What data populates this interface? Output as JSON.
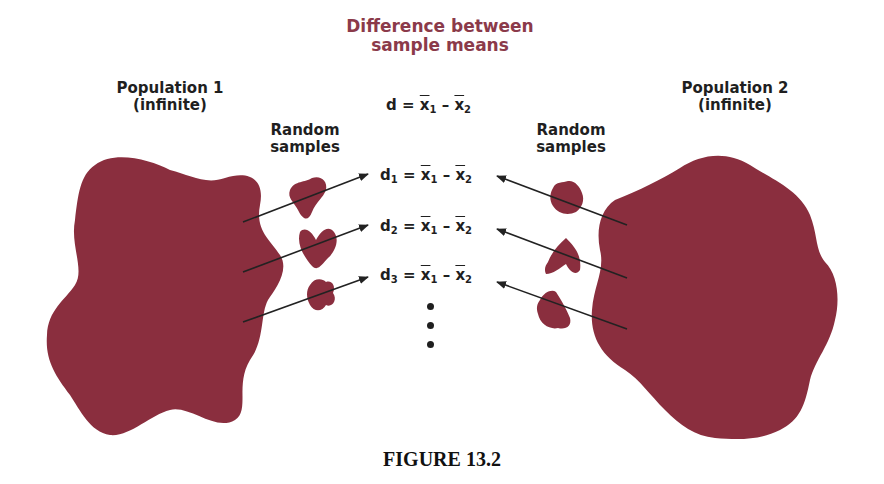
{
  "title": "Difference between sample means",
  "title_lines": [
    "Difference between",
    "sample means"
  ],
  "population1": {
    "label": "Population 1",
    "sublabel": "(infinite)"
  },
  "population2": {
    "label": "Population 2",
    "sublabel": "(infinite)"
  },
  "samples_left": {
    "line1": "Random",
    "line2": "samples"
  },
  "samples_right": {
    "line1": "Random",
    "line2": "samples"
  },
  "equations": {
    "main": {
      "lhs": "d",
      "lhs_sub": "",
      "x1": "x",
      "s1": "1",
      "x2": "x",
      "s2": "2"
    },
    "rows": [
      {
        "lhs": "d",
        "lhs_sub": "1",
        "x1": "x",
        "s1": "1",
        "x2": "x",
        "s2": "2"
      },
      {
        "lhs": "d",
        "lhs_sub": "2",
        "x1": "x",
        "s1": "1",
        "x2": "x",
        "s2": "2"
      },
      {
        "lhs": "d",
        "lhs_sub": "3",
        "x1": "x",
        "s1": "1",
        "x2": "x",
        "s2": "2"
      }
    ],
    "equals": "=",
    "minus": "–"
  },
  "ellipsis": "⋮",
  "caption": "FIGURE 13.2",
  "colors": {
    "blob": "#8a2e3e",
    "title": "#8b3a4a",
    "text": "#1f1f1f",
    "arrow": "#222222"
  }
}
